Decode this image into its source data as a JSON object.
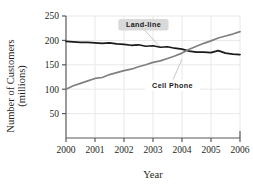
{
  "chart_data": {
    "type": "line",
    "title": "",
    "xlabel": "Year",
    "ylabel": "Number of Customers (millions)",
    "ylabel_line1": "Number of Customers",
    "ylabel_line2": "(millions)",
    "xlim": [
      2000,
      2006
    ],
    "ylim": [
      0,
      250
    ],
    "xticks": [
      "2000",
      "2001",
      "2002",
      "2003",
      "2004",
      "2005",
      "2006"
    ],
    "xtick_values": [
      2000,
      2001,
      2002,
      2003,
      2004,
      2005,
      2006
    ],
    "yticks": [
      "50",
      "100",
      "150",
      "200",
      "250"
    ],
    "ytick_values": [
      50,
      100,
      150,
      200,
      250
    ],
    "grid": true,
    "legend_position": "inline-annotations",
    "series": [
      {
        "name": "Land-line",
        "color": "#1a1a1a",
        "label_x": 2002.05,
        "label_y": 232,
        "leader_to_x": 2003.25,
        "leader_to_y": 186,
        "x": [
          2000.0,
          2000.25,
          2000.5,
          2000.75,
          2001.0,
          2001.25,
          2001.5,
          2001.75,
          2002.0,
          2002.25,
          2002.5,
          2002.75,
          2003.0,
          2003.25,
          2003.5,
          2003.75,
          2004.0,
          2004.25,
          2004.5,
          2004.75,
          2005.0,
          2005.25,
          2005.5,
          2005.75,
          2006.0
        ],
        "values": [
          198,
          197,
          196,
          196,
          195,
          194,
          195,
          193,
          192,
          190,
          191,
          188,
          189,
          186,
          187,
          184,
          182,
          178,
          176,
          176,
          175,
          179,
          174,
          172,
          171
        ]
      },
      {
        "name": "Cell Phone",
        "color": "#808080",
        "label_x": 2003.05,
        "label_y": 108,
        "leader_to_x": 2004.0,
        "leader_to_y": 162,
        "x": [
          2000.0,
          2000.25,
          2000.5,
          2000.75,
          2001.0,
          2001.25,
          2001.5,
          2001.75,
          2002.0,
          2002.25,
          2002.5,
          2002.75,
          2003.0,
          2003.25,
          2003.5,
          2003.75,
          2004.0,
          2004.25,
          2004.5,
          2004.75,
          2005.0,
          2005.25,
          2005.5,
          2005.75,
          2006.0
        ],
        "values": [
          100,
          107,
          112,
          117,
          122,
          124,
          130,
          134,
          138,
          141,
          146,
          150,
          155,
          158,
          163,
          168,
          174,
          182,
          188,
          194,
          199,
          205,
          209,
          213,
          218
        ]
      }
    ]
  },
  "annotations": {
    "landline_label": "Land-line",
    "cellphone_label": "Cell Phone"
  },
  "colors": {
    "landline": "#1a1a1a",
    "cellphone": "#808080",
    "axis": "#58595b",
    "grid": "#e8e8e8",
    "text": "#231f20",
    "badge_bg": "#d9d9d9"
  }
}
